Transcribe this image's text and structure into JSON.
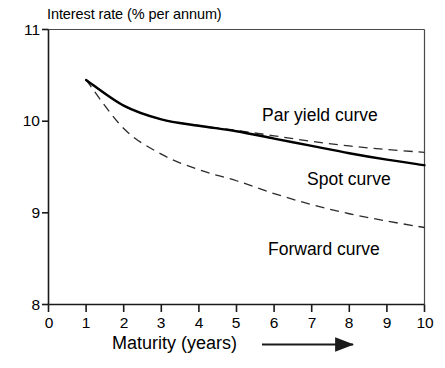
{
  "chart_data": {
    "type": "line",
    "title": "",
    "ylabel": "Interest rate (% per annum)",
    "xlabel": "Maturity (years)",
    "xlabel_arrow": "arrow-right",
    "xlim": [
      0,
      10
    ],
    "ylim": [
      8,
      11
    ],
    "xticks": [
      "0",
      "1",
      "2",
      "3",
      "4",
      "5",
      "6",
      "7",
      "8",
      "9",
      "10"
    ],
    "yticks": [
      "8",
      "9",
      "10",
      "11"
    ],
    "grid": false,
    "legend": "inline-annotations",
    "x": [
      1,
      2,
      3,
      4,
      5,
      6,
      7,
      8,
      9,
      10
    ],
    "series": [
      {
        "name": "Par yield curve",
        "style": "dashed",
        "label": "Par yield curve",
        "values": [
          10.45,
          10.17,
          10.02,
          9.95,
          9.9,
          9.84,
          9.78,
          9.73,
          9.69,
          9.66
        ]
      },
      {
        "name": "Spot curve",
        "style": "solid",
        "label": "Spot curve",
        "values": [
          10.45,
          10.17,
          10.02,
          9.95,
          9.89,
          9.81,
          9.73,
          9.65,
          9.58,
          9.52
        ]
      },
      {
        "name": "Forward curve",
        "style": "dashed",
        "label": "Forward curve",
        "values": [
          10.45,
          9.92,
          9.64,
          9.47,
          9.35,
          9.21,
          9.09,
          8.99,
          8.91,
          8.84
        ]
      }
    ],
    "colors": {
      "axis": "#1a1a1a",
      "spot_curve": "#000000",
      "par_yield_curve": "#333333",
      "forward_curve": "#333333",
      "background": "#ffffff"
    }
  },
  "annotations": {
    "par_label": "Par yield curve",
    "spot_label": "Spot curve",
    "forward_label": "Forward curve"
  },
  "axes": {
    "y_title": "Interest rate (% per annum)",
    "x_title": "Maturity (years)",
    "y_tick_11": "11",
    "y_tick_10": "10",
    "y_tick_9": "9",
    "y_tick_8": "8",
    "x_tick_0": "0",
    "x_tick_1": "1",
    "x_tick_2": "2",
    "x_tick_3": "3",
    "x_tick_4": "4",
    "x_tick_5": "5",
    "x_tick_6": "6",
    "x_tick_7": "7",
    "x_tick_8": "8",
    "x_tick_9": "9",
    "x_tick_10": "10"
  }
}
